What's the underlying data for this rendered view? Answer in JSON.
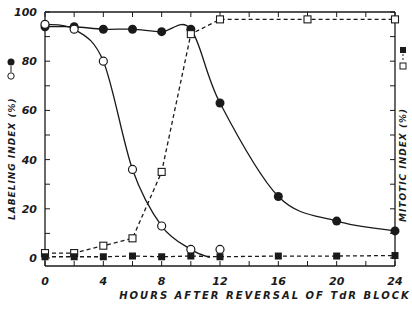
{
  "chart_data": {
    "type": "line",
    "title": "",
    "xlabel": "HOURS AFTER REVERSAL OF TdR BLOCK",
    "ylabel_left": "LABELING INDEX (%)",
    "ylabel_right": "MITOTIC INDEX (%)",
    "legend_left": "●–○",
    "legend_right": "□--■",
    "xlim": [
      0,
      24
    ],
    "ylim": [
      0,
      100
    ],
    "x_ticks": [
      0,
      4,
      8,
      12,
      16,
      20,
      24
    ],
    "x_minor_ticks": [
      2,
      6,
      10,
      14,
      18,
      22
    ],
    "y_ticks_left": [
      0,
      20,
      40,
      60,
      80,
      100
    ],
    "grid": false,
    "series": [
      {
        "name": "Labeling index (filled circles)",
        "marker": "filled-circle",
        "line": "solid",
        "axis": "left",
        "x": [
          0,
          2,
          4,
          6,
          8,
          10,
          12,
          16,
          20,
          24
        ],
        "y": [
          94,
          94,
          93,
          93,
          92,
          93,
          63,
          25,
          15,
          11
        ]
      },
      {
        "name": "Labeling index (open circles)",
        "marker": "open-circle",
        "line": "solid",
        "axis": "left",
        "x": [
          0,
          2,
          4,
          6,
          8,
          10,
          12
        ],
        "y": [
          95,
          93,
          80,
          36,
          13,
          3.5,
          3.5
        ]
      },
      {
        "name": "Mitotic index (open squares)",
        "marker": "open-square",
        "line": "dashed",
        "axis": "right",
        "x": [
          0,
          2,
          4,
          6,
          8,
          10,
          12,
          18,
          24
        ],
        "y": [
          2,
          2,
          5,
          8,
          35,
          91,
          97,
          97,
          97
        ]
      },
      {
        "name": "Mitotic index (filled squares)",
        "marker": "filled-square",
        "line": "dashed",
        "axis": "right",
        "x": [
          0,
          2,
          4,
          6,
          8,
          10,
          12,
          16,
          20,
          24
        ],
        "y": [
          0.5,
          0.5,
          0.5,
          0.8,
          0.5,
          0.8,
          0.5,
          0.8,
          0.8,
          1
        ]
      }
    ]
  },
  "labels": {
    "xlabel": "HOURS   AFTER   REVERSAL   OF   TdR   BLOCK",
    "ylabel_left": "LABELING   INDEX  (%)",
    "ylabel_right": "MITOTIC   INDEX  (%)",
    "legend_left_filled": "●",
    "legend_left_open": "○",
    "legend_right_open": "□",
    "legend_right_filled": "■"
  },
  "colors": {
    "ink": "#1a1a1a",
    "background": "#ffffff"
  }
}
